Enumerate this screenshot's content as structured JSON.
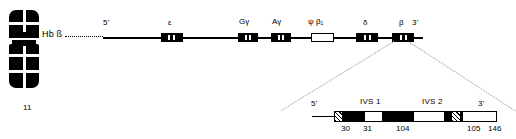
{
  "figure": {
    "chromosome": {
      "number": "11",
      "locus_label": "Hb ß"
    }
  },
  "locus_map": {
    "five_prime": "5'",
    "three_prime": "3'",
    "genes": [
      {
        "id": "epsilon",
        "label": "ε",
        "type": "filled"
      },
      {
        "id": "g-gamma",
        "label": "Gγ",
        "type": "filled"
      },
      {
        "id": "a-gamma",
        "label": "Aγ",
        "type": "filled"
      },
      {
        "id": "psi-beta1",
        "label": "ψ β₁",
        "type": "open"
      },
      {
        "id": "delta",
        "label": "δ",
        "type": "filled"
      },
      {
        "id": "beta",
        "label": "β",
        "type": "filled"
      }
    ]
  },
  "beta_gene_detail": {
    "five_prime": "5'",
    "three_prime": "3'",
    "introns": [
      {
        "id": "ivs1",
        "label": "IVS 1"
      },
      {
        "id": "ivs2",
        "label": "IVS 2"
      }
    ],
    "codon_markers": [
      "30",
      "31",
      "104",
      "105",
      "146"
    ]
  },
  "colors": {
    "ink": "#000000",
    "paper": "#ffffff",
    "leader": "#9a9a9a"
  }
}
